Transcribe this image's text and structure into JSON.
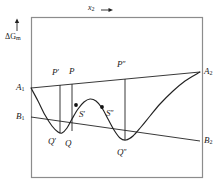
{
  "figure": {
    "type": "diagram",
    "frame": {
      "x0": 31,
      "y0": 17,
      "x1": 202,
      "y1": 177,
      "stroke": "#8c8c8c"
    },
    "stroke_color": "#222222",
    "axes": {
      "y_axis_label": "ΔG",
      "y_axis_sub": "m",
      "y_axis_arrow": "↑",
      "x_axis_label": "x",
      "x_axis_sub": "2",
      "x_axis_arrow": "←"
    },
    "lines": [
      {
        "name": "upper-tangent-A1-A2",
        "from": [
          31,
          88
        ],
        "to": [
          200,
          72
        ]
      },
      {
        "name": "lower-tangent-B1-B2",
        "from": [
          31,
          117
        ],
        "to": [
          200,
          141
        ]
      },
      {
        "name": "tie-line-P-prime-Q-prime",
        "x": 60,
        "y_top": 85,
        "y_bottom": 133
      },
      {
        "name": "tie-line-P-Q",
        "x": 72,
        "y_top": 84,
        "y_bottom": 131
      },
      {
        "name": "tie-line-P-dblprime-Q-dblprime",
        "x": 125,
        "y_top": 79,
        "y_bottom": 140
      }
    ],
    "curve": {
      "name": "free-energy-curve",
      "points": [
        [
          31,
          88
        ],
        [
          38,
          101
        ],
        [
          45,
          115
        ],
        [
          52,
          126
        ],
        [
          58,
          132
        ],
        [
          62,
          133
        ],
        [
          67,
          128
        ],
        [
          72,
          119
        ],
        [
          78,
          109
        ],
        [
          84,
          102
        ],
        [
          90,
          99
        ],
        [
          96,
          101
        ],
        [
          102,
          108
        ],
        [
          108,
          119
        ],
        [
          114,
          130
        ],
        [
          120,
          138
        ],
        [
          126,
          140
        ],
        [
          133,
          136
        ],
        [
          141,
          127
        ],
        [
          150,
          116
        ],
        [
          160,
          104
        ],
        [
          172,
          92
        ],
        [
          185,
          81
        ],
        [
          200,
          72
        ]
      ]
    },
    "markers": [
      {
        "name": "spinodal-point-S-prime",
        "x": 76,
        "y": 105
      },
      {
        "name": "spinodal-point-S-dblprime",
        "x": 102,
        "y": 107
      }
    ],
    "labels": [
      {
        "name": "label-A1",
        "text": "A",
        "sub": "1",
        "prime": "",
        "x": 16,
        "y": 83
      },
      {
        "name": "label-A2",
        "text": "A",
        "sub": "2",
        "prime": "",
        "x": 204,
        "y": 67
      },
      {
        "name": "label-B1",
        "text": "B",
        "sub": "1",
        "prime": "",
        "x": 16,
        "y": 112
      },
      {
        "name": "label-B2",
        "text": "B",
        "sub": "2",
        "prime": "",
        "x": 204,
        "y": 136
      },
      {
        "name": "label-P-prime",
        "text": "P",
        "sub": "",
        "prime": "′",
        "x": 52,
        "y": 68
      },
      {
        "name": "label-P",
        "text": "P",
        "sub": "",
        "prime": "",
        "x": 69,
        "y": 67
      },
      {
        "name": "label-P-dblprime",
        "text": "P",
        "sub": "",
        "prime": "″",
        "x": 117,
        "y": 60
      },
      {
        "name": "label-Q-prime",
        "text": "Q",
        "sub": "",
        "prime": "′",
        "x": 48,
        "y": 137
      },
      {
        "name": "label-Q",
        "text": "Q",
        "sub": "",
        "prime": "",
        "x": 65,
        "y": 139
      },
      {
        "name": "label-Q-dblprime",
        "text": "Q",
        "sub": "",
        "prime": "″",
        "x": 117,
        "y": 148
      },
      {
        "name": "label-S-prime",
        "text": "S",
        "sub": "",
        "prime": "′",
        "x": 79,
        "y": 110
      },
      {
        "name": "label-S-dblprime",
        "text": "S",
        "sub": "",
        "prime": "″",
        "x": 106,
        "y": 109
      }
    ]
  }
}
